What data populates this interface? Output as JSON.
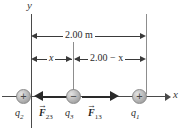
{
  "figure": {
    "type": "physics-force-diagram"
  },
  "axes": {
    "y_label": "y",
    "x_label": "x"
  },
  "dimensions": [
    {
      "id": "total",
      "label": "2.00 m",
      "from": "q2",
      "to": "q1"
    },
    {
      "id": "left_segment",
      "label": "x",
      "from": "q2",
      "to": "q3"
    },
    {
      "id": "right_segment",
      "label": "2.00 − x",
      "from": "q3",
      "to": "q1"
    }
  ],
  "charges": [
    {
      "id": "q2",
      "label": "q",
      "subscript": "2",
      "sign": "+",
      "position": "origin"
    },
    {
      "id": "q3",
      "label": "q",
      "subscript": "3",
      "sign": "−",
      "position": "middle"
    },
    {
      "id": "q1",
      "label": "q",
      "subscript": "1",
      "sign": "+",
      "position": "right"
    }
  ],
  "forces": [
    {
      "id": "F23",
      "symbol": "F",
      "subscript": "23",
      "direction": "left",
      "vector_accent": "→"
    },
    {
      "id": "F13",
      "symbol": "F",
      "subscript": "13",
      "direction": "right",
      "vector_accent": "→"
    }
  ],
  "colors": {
    "axis": "#4a4a4a",
    "guide": "#8d8d8d",
    "dimension": "#3a3a3a",
    "force": "#2a2a2a",
    "text": "#2b2b2b",
    "background": "#ffffff"
  }
}
